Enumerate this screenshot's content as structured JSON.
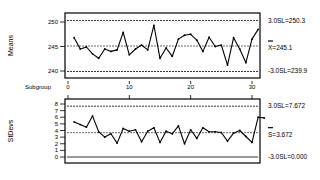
{
  "chart_data": [
    {
      "type": "line",
      "title": "",
      "ylabel": "Means",
      "xlabel": "Subgroup",
      "x_ticks": [
        0,
        10,
        20,
        30
      ],
      "y_ticks": [
        240,
        245,
        250
      ],
      "ylim": [
        238.7,
        251.7
      ],
      "x": [
        1,
        2,
        3,
        4,
        5,
        6,
        7,
        8,
        9,
        10,
        11,
        12,
        13,
        14,
        15,
        16,
        17,
        18,
        19,
        20,
        21,
        22,
        23,
        24,
        25,
        26,
        27,
        28,
        29,
        30
      ],
      "values": [
        246.8,
        244.5,
        244.9,
        243.5,
        242.6,
        244.5,
        244.0,
        244.3,
        247.9,
        243.3,
        244.5,
        245.3,
        244.3,
        249.3,
        242.6,
        244.7,
        243.0,
        246.5,
        247.3,
        247.5,
        246.3,
        244.0,
        246.9,
        245.0,
        245.3,
        241.2,
        246.8,
        244.5,
        241.7,
        246.5,
        248.5
      ],
      "limits": {
        "ucl": {
          "label": "3.0SL=250.3",
          "value": 250.3
        },
        "center": {
          "label": "X=245.1",
          "value": 245.1
        },
        "lcl": {
          "label": "-3.0SL=239.9",
          "value": 239.9
        }
      },
      "grid": false
    },
    {
      "type": "line",
      "title": "",
      "ylabel": "StDevs",
      "xlabel": "",
      "x_ticks": [
        0,
        10,
        20,
        30
      ],
      "y_ticks": [
        0,
        1,
        2,
        3,
        4,
        5,
        6,
        7,
        8
      ],
      "ylim": [
        -0.6,
        8.6
      ],
      "x": [
        1,
        2,
        3,
        4,
        5,
        6,
        7,
        8,
        9,
        10,
        11,
        12,
        13,
        14,
        15,
        16,
        17,
        18,
        19,
        20,
        21,
        22,
        23,
        24,
        25,
        26,
        27,
        28,
        29,
        30
      ],
      "values": [
        5.3,
        4.9,
        4.5,
        6.2,
        3.8,
        3.0,
        3.5,
        2.1,
        4.3,
        3.9,
        4.1,
        2.3,
        3.9,
        4.4,
        2.2,
        3.9,
        3.5,
        4.7,
        2.0,
        4.1,
        2.8,
        4.4,
        3.8,
        3.8,
        3.7,
        2.4,
        3.6,
        4.0,
        3.1,
        2.2,
        6.0,
        5.9
      ],
      "limits": {
        "ucl": {
          "label": "3.0SL=7.672",
          "value": 7.672
        },
        "center": {
          "label": "S=3.672",
          "value": 3.672
        },
        "lcl": {
          "label": "-3.0SL=0.000",
          "value": 0.0
        }
      },
      "grid": false
    }
  ]
}
